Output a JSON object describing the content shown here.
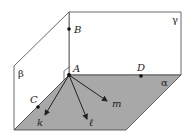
{
  "diagram": {
    "title": "",
    "planes": [
      {
        "id": "alpha",
        "label": "α"
      },
      {
        "id": "beta",
        "label": "β"
      },
      {
        "id": "gamma",
        "label": "γ"
      }
    ],
    "points": [
      {
        "id": "A",
        "label": "A"
      },
      {
        "id": "B",
        "label": "B"
      },
      {
        "id": "C",
        "label": "C"
      },
      {
        "id": "D",
        "label": "D"
      }
    ],
    "rays": [
      {
        "id": "k",
        "label": "k"
      },
      {
        "id": "l",
        "label": "ℓ"
      },
      {
        "id": "m",
        "label": "m"
      }
    ],
    "colors": {
      "alpha_fill": "#a8a8a8",
      "line": "#333333",
      "background": "#ffffff"
    }
  }
}
